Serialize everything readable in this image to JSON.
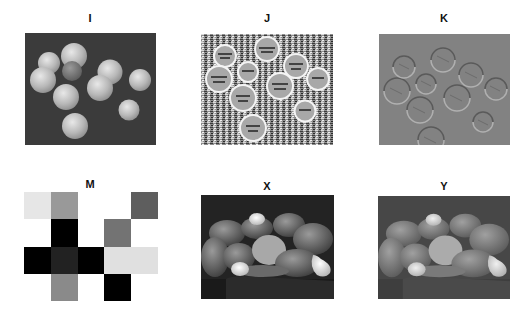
{
  "figure": {
    "panels": [
      {
        "id": "I",
        "title": "I",
        "description": "grayscale photo of coins on dark background",
        "bg": "#3a3a3a"
      },
      {
        "id": "J",
        "title": "J",
        "description": "high-pass / emboss filtered coins, noisy texture",
        "bg": "#8a8a8a"
      },
      {
        "id": "K",
        "title": "K",
        "description": "embossed coins on mid-gray background",
        "bg": "#808080"
      },
      {
        "id": "M",
        "title": "M",
        "description": "5x4 grayscale matrix image"
      },
      {
        "id": "X",
        "title": "X",
        "description": "grayscale photo of peppers and garlic",
        "bg": "#2a2a2a"
      },
      {
        "id": "Y",
        "title": "Y",
        "description": "lower-contrast version of peppers image",
        "bg": "#4a4a4a"
      }
    ],
    "matrix_M": {
      "rows": 4,
      "cols": 5,
      "colors": [
        [
          "#e6e6e6",
          "#999999",
          "#ffffff",
          "#ffffff",
          "#5e5e5e"
        ],
        [
          "#ffffff",
          "#000000",
          "#ffffff",
          "#737373",
          "#ffffff"
        ],
        [
          "#000000",
          "#222222",
          "#000000",
          "#e0e0e0",
          "#e0e0e0"
        ],
        [
          "#ffffff",
          "#8a8a8a",
          "#ffffff",
          "#000000",
          "#ffffff"
        ]
      ]
    }
  }
}
